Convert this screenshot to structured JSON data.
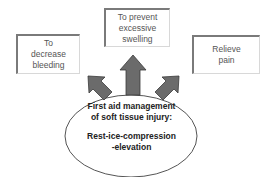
{
  "diagram": {
    "center": {
      "title_lines": [
        "First aid management",
        "of soft tissue injury:"
      ],
      "method_lines": [
        "Rest-ice-compression",
        "-elevation"
      ]
    },
    "goals": {
      "left": {
        "lines": [
          "To",
          "decrease",
          "bleeding"
        ]
      },
      "center": {
        "lines": [
          "To prevent",
          "excessive",
          "swelling"
        ]
      },
      "right": {
        "lines": [
          "Relieve",
          "pain"
        ]
      }
    },
    "colors": {
      "arrow_fill": "#6b6b6b",
      "arrow_stroke": "#3a3a3a",
      "box_border_dark": "#7a7a7a",
      "box_border_light": "#d8d8d8",
      "text_gray": "#555555",
      "text_dark": "#222222"
    }
  }
}
